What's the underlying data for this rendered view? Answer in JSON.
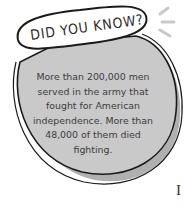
{
  "callout": {
    "title": "DID YOU KNOW?",
    "body_lines": [
      "More than 200,000 men",
      "served in the army that",
      "fought for American",
      "independence. More than",
      "48,000 of them died",
      "fighting."
    ],
    "colors": {
      "bubble_fill": "#c8c8c8",
      "bubble_shadow": "#a9a9a9",
      "outline": "#1a1a1a",
      "title_fill": "#ffffff",
      "background": "#ffffff"
    }
  },
  "page_fragment": {
    "edge_char": "I",
    "partial_line": "...s of the..."
  }
}
